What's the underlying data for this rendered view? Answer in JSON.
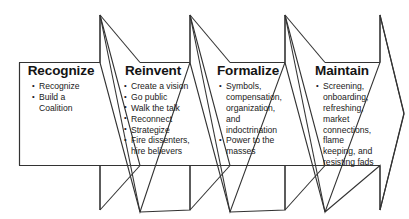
{
  "diagram": {
    "outline_color": "#333333",
    "background_color": "#ffffff",
    "text_color": "#1a1a1a",
    "heading_color": "#141414",
    "bullet_glyph": "bullet-point",
    "stages": [
      {
        "id": "recognize",
        "heading": "Recognize",
        "items": [
          "Recognize",
          "Build a Coalition"
        ]
      },
      {
        "id": "reinvent",
        "heading": "Reinvent",
        "items": [
          "Create a vision",
          "Go public",
          "Walk the talk",
          "Reconnect",
          "Strategize",
          "Fire dissenters, hire believers"
        ]
      },
      {
        "id": "formalize",
        "heading": "Formalize",
        "items": [
          "Symbols, compensation, organization, and indoctrination",
          "Power to the masses"
        ]
      },
      {
        "id": "maintain",
        "heading": "Maintain",
        "items": [
          "Screening, onboarding, refreshing, market connec­tions, flame keeping, and resisting fads"
        ]
      }
    ]
  }
}
